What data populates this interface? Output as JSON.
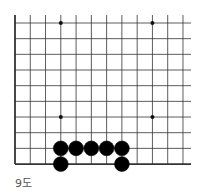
{
  "diagram": {
    "type": "go-board-fragment",
    "caption": "9도",
    "grid": {
      "columns": 12,
      "rows": 10,
      "origin_x": 15,
      "origin_y": 23,
      "spacing_x": 15.27,
      "spacing_y": 15.67,
      "left_edge": true,
      "bottom_edge": true,
      "line_color": "#333333"
    },
    "star_points": [
      {
        "col": 3,
        "row": 0
      },
      {
        "col": 9,
        "row": 0
      },
      {
        "col": 3,
        "row": 6
      },
      {
        "col": 9,
        "row": 6
      }
    ],
    "stones": [
      {
        "color": "black",
        "col": 3,
        "row": 8
      },
      {
        "color": "black",
        "col": 4,
        "row": 8
      },
      {
        "color": "black",
        "col": 5,
        "row": 8
      },
      {
        "color": "black",
        "col": 6,
        "row": 8
      },
      {
        "color": "black",
        "col": 7,
        "row": 8
      },
      {
        "color": "black",
        "col": 3,
        "row": 9
      },
      {
        "color": "black",
        "col": 7,
        "row": 9
      }
    ]
  }
}
